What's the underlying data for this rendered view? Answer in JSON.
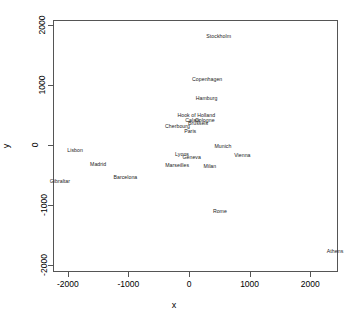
{
  "chart_data": {
    "type": "scatter",
    "title": "",
    "xlabel": "x",
    "ylabel": "y",
    "xlim": [
      -2230,
      2450
    ],
    "ylim": [
      -2100,
      2070
    ],
    "xticks": [
      -2000,
      -1000,
      0,
      1000,
      2000
    ],
    "yticks": [
      -2000,
      -1000,
      0,
      1000,
      2000
    ],
    "xticklabels": [
      "-2000",
      "-1000",
      "0",
      "1000",
      "2000"
    ],
    "yticklabels": [
      "-2000",
      "-1000",
      "0",
      "1000",
      "2000"
    ],
    "grid": false,
    "legend": null,
    "marker": "text-label",
    "labels": [
      "Athens",
      "Barcelona",
      "Brussels",
      "Calais",
      "Cherbourg",
      "Cologne",
      "Copenhagen",
      "Geneva",
      "Gibraltar",
      "Hamburg",
      "Hook of Holland",
      "Lisbon",
      "Lyons",
      "Madrid",
      "Marseilles",
      "Milan",
      "Munich",
      "Paris",
      "Rome",
      "Stockholm",
      "Vienna"
    ],
    "points": [
      {
        "label": "Stockholm",
        "x": 490,
        "y": 1800
      },
      {
        "label": "Copenhagen",
        "x": 300,
        "y": 1080
      },
      {
        "label": "Hamburg",
        "x": 290,
        "y": 760
      },
      {
        "label": "Hook of Holland",
        "x": 120,
        "y": 490
      },
      {
        "label": "Cologne",
        "x": 260,
        "y": 400
      },
      {
        "label": "Calais",
        "x": 60,
        "y": 400
      },
      {
        "label": "Brussels",
        "x": 150,
        "y": 350
      },
      {
        "label": "Cherbourg",
        "x": -190,
        "y": 295
      },
      {
        "label": "Paris",
        "x": 20,
        "y": 215
      },
      {
        "label": "Munich",
        "x": 560,
        "y": -40
      },
      {
        "label": "Lisbon",
        "x": -1880,
        "y": -100
      },
      {
        "label": "Vienna",
        "x": 880,
        "y": -175
      },
      {
        "label": "Lyons",
        "x": -115,
        "y": -165
      },
      {
        "label": "Geneva",
        "x": 45,
        "y": -215
      },
      {
        "label": "Madrid",
        "x": -1500,
        "y": -330
      },
      {
        "label": "Marseilles",
        "x": -195,
        "y": -350
      },
      {
        "label": "Milan",
        "x": 345,
        "y": -360
      },
      {
        "label": "Barcelona",
        "x": -1050,
        "y": -545
      },
      {
        "label": "Gibraltar",
        "x": -2130,
        "y": -610
      },
      {
        "label": "Rome",
        "x": 510,
        "y": -1120
      },
      {
        "label": "Athens",
        "x": 2410,
        "y": -1790
      }
    ]
  }
}
